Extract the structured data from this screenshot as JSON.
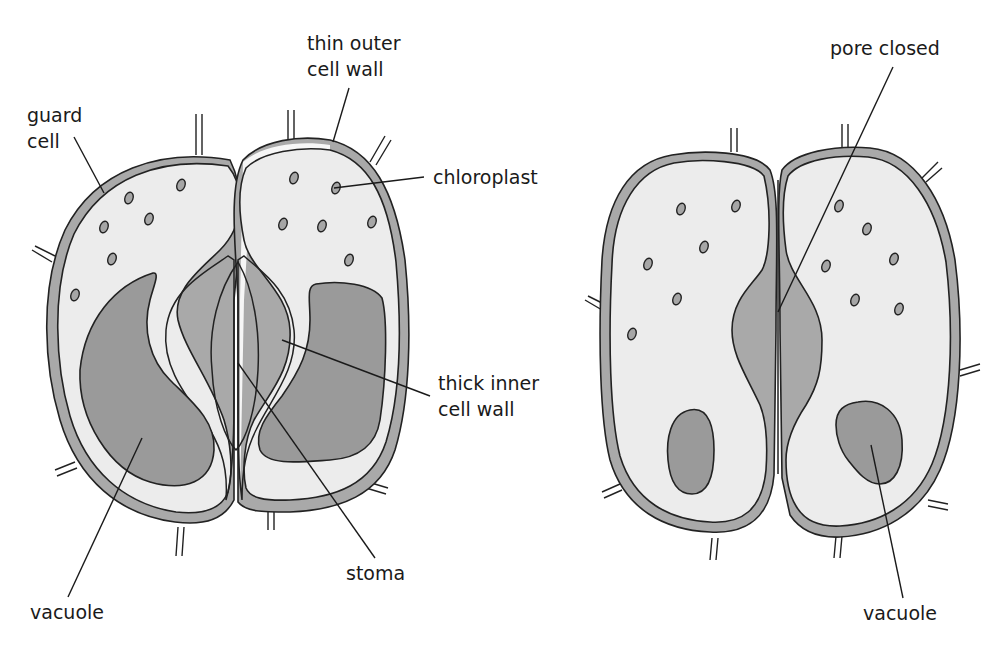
{
  "diagram": {
    "colors": {
      "background": "#ffffff",
      "outer_wall": "#a9a9a9",
      "cytoplasm": "#ececec",
      "inner_wall": "#f6f6f6",
      "vacuole": "#9a9a9a",
      "chloroplast": "#a6a6a6",
      "pore": "#ffffff",
      "line": "#1a1a1a"
    },
    "open_stoma": {
      "labels": {
        "guard_cell": [
          "guard",
          "cell"
        ],
        "thin_outer_cell_wall": [
          "thin outer",
          "cell wall"
        ],
        "chloroplast": "chloroplast",
        "thick_inner_cell_wall": [
          "thick inner",
          "cell wall"
        ],
        "stoma": "stoma",
        "vacuole": "vacuole"
      }
    },
    "closed_stoma": {
      "labels": {
        "pore_closed": "pore closed",
        "vacuole": "vacuole"
      }
    }
  }
}
